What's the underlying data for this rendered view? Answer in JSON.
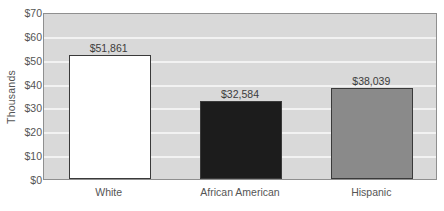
{
  "chart_data": {
    "type": "bar",
    "title": "",
    "xlabel": "",
    "ylabel": "Thousands",
    "categories": [
      "White",
      "African American",
      "Hispanic"
    ],
    "values": [
      51861,
      32584,
      38039
    ],
    "value_labels": [
      "$51,861",
      "$32,584",
      "$38,039"
    ],
    "bar_colors": [
      "#ffffff",
      "#1c1c1c",
      "#8a8a8a"
    ],
    "bar_border_color": "#3a3a3a",
    "ylim": [
      0,
      70000
    ],
    "y_tick_values": [
      0,
      10000,
      20000,
      30000,
      40000,
      50000,
      60000,
      70000
    ],
    "y_tick_labels": [
      "$0",
      "$10",
      "$20",
      "$30",
      "$40",
      "$50",
      "$60",
      "$70"
    ],
    "y_unit_scale": 1000,
    "grid": true,
    "grid_color": "#f2f2f2",
    "legend": null,
    "legend_position": "none",
    "plot_background": "#d9d9d9",
    "figure_background": "#ffffff",
    "axis_color": "#8f8f8f",
    "text_color": "#555555"
  }
}
